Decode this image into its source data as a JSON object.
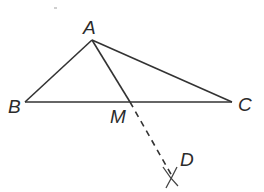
{
  "diagram": {
    "type": "geometry-construction",
    "points": {
      "A": {
        "label": "A",
        "x": 92,
        "y": 40
      },
      "B": {
        "label": "B",
        "x": 25,
        "y": 102
      },
      "C": {
        "label": "C",
        "x": 232,
        "y": 102
      },
      "M": {
        "label": "M",
        "x": 130,
        "y": 102
      },
      "D": {
        "label": "D",
        "x": 172,
        "y": 176
      }
    },
    "segments": [
      {
        "from": "A",
        "to": "B",
        "style": "solid"
      },
      {
        "from": "A",
        "to": "C",
        "style": "solid"
      },
      {
        "from": "B",
        "to": "C",
        "style": "solid"
      },
      {
        "from": "A",
        "to": "M",
        "style": "solid"
      },
      {
        "from": "M",
        "to": "D",
        "style": "dashed"
      }
    ],
    "line_color": "#333333"
  }
}
